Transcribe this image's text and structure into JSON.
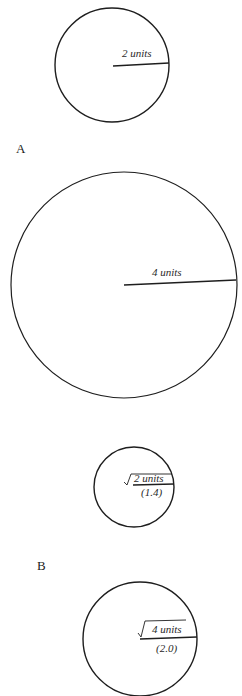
{
  "figure": {
    "panel_a": {
      "label": "A",
      "circles": [
        {
          "radius_label": "2 units"
        },
        {
          "radius_label": "4 units"
        }
      ]
    },
    "panel_b": {
      "label": "B",
      "circles": [
        {
          "radical": "√",
          "radius_label": "2 units",
          "approx": "(1.4)"
        },
        {
          "radical": "√",
          "radius_label": "4 units",
          "approx": "(2.0)"
        }
      ]
    }
  }
}
